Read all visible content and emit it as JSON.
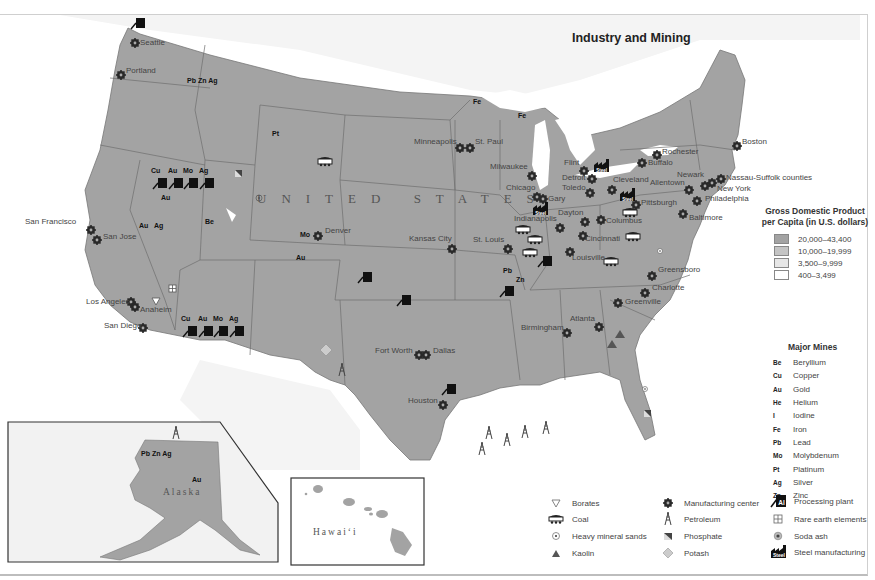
{
  "title": "Industry and Mining",
  "country_label": "UNITED STATES",
  "colors": {
    "gdp_high": "#a3a3a3",
    "gdp_mid": "#c4c4c4",
    "gdp_low": "#e6e6e6",
    "gdp_lowest": "#ffffff",
    "state_border": "#6a6a6a",
    "water": "#ffffff",
    "foreign_land": "#ececec"
  },
  "gdp_legend": {
    "title_line1": "Gross Domestic Product",
    "title_line2": "per Capita (in U.S. dollars)",
    "ranges": [
      {
        "label": "20,000–43,400",
        "color": "#a3a3a3"
      },
      {
        "label": "10,000–19,999",
        "color": "#c4c4c4"
      },
      {
        "label": "3,500–9,999",
        "color": "#e6e6e6"
      },
      {
        "label": "400–3,499",
        "color": "#ffffff"
      }
    ]
  },
  "mines_legend": {
    "title": "Major Mines",
    "items": [
      {
        "abbr": "Be",
        "name": "Beryllium"
      },
      {
        "abbr": "Cu",
        "name": "Copper"
      },
      {
        "abbr": "Au",
        "name": "Gold"
      },
      {
        "abbr": "He",
        "name": "Helium"
      },
      {
        "abbr": "I",
        "name": "Iodine"
      },
      {
        "abbr": "Fe",
        "name": "Iron"
      },
      {
        "abbr": "Pb",
        "name": "Lead"
      },
      {
        "abbr": "Mo",
        "name": "Molybdenum"
      },
      {
        "abbr": "Pt",
        "name": "Platinum"
      },
      {
        "abbr": "Ag",
        "name": "Silver"
      },
      {
        "abbr": "Zn",
        "name": "Zinc"
      }
    ]
  },
  "symbol_legend": {
    "col1": [
      {
        "icon": "borates-triangle-icon",
        "label": "Borates"
      },
      {
        "icon": "coal-car-icon",
        "label": "Coal"
      },
      {
        "icon": "heavy-mineral-sands-icon",
        "label": "Heavy mineral sands"
      },
      {
        "icon": "kaolin-triangle-icon",
        "label": "Kaolin"
      }
    ],
    "col2": [
      {
        "icon": "manufacturing-gear-icon",
        "label": "Manufacturing center"
      },
      {
        "icon": "petroleum-derrick-icon",
        "label": "Petroleum"
      },
      {
        "icon": "phosphate-icon",
        "label": "Phosphate"
      },
      {
        "icon": "potash-diamond-icon",
        "label": "Potash"
      }
    ],
    "col3": [
      {
        "icon": "processing-plant-icon",
        "label": "Processing plant",
        "glyph": "Al"
      },
      {
        "icon": "rare-earth-icon",
        "label": "Rare earth elements"
      },
      {
        "icon": "soda-ash-icon",
        "label": "Soda ash"
      },
      {
        "icon": "steel-factory-icon",
        "label": "Steel manufacturing",
        "glyph": "Steel"
      }
    ]
  },
  "cities": [
    {
      "name": "Seattle",
      "x": 140,
      "y": 43
    },
    {
      "name": "Portland",
      "x": 126,
      "y": 71
    },
    {
      "name": "San Francisco",
      "x": 25,
      "y": 222
    },
    {
      "name": "San Jose",
      "x": 103,
      "y": 237
    },
    {
      "name": "Los Angeles",
      "x": 86,
      "y": 302
    },
    {
      "name": "Anaheim",
      "x": 140,
      "y": 310
    },
    {
      "name": "San Diego",
      "x": 104,
      "y": 326
    },
    {
      "name": "Denver",
      "x": 325,
      "y": 231
    },
    {
      "name": "Minneapolis",
      "x": 414,
      "y": 142
    },
    {
      "name": "St. Paul",
      "x": 475,
      "y": 142
    },
    {
      "name": "Milwaukee",
      "x": 490,
      "y": 167
    },
    {
      "name": "Chicago",
      "x": 506,
      "y": 188
    },
    {
      "name": "Gary",
      "x": 548,
      "y": 199
    },
    {
      "name": "Flint",
      "x": 564,
      "y": 163
    },
    {
      "name": "Detroit",
      "x": 562,
      "y": 178
    },
    {
      "name": "Toledo",
      "x": 562,
      "y": 188
    },
    {
      "name": "Cleveland",
      "x": 613,
      "y": 180
    },
    {
      "name": "Pittsburgh",
      "x": 641,
      "y": 203
    },
    {
      "name": "Rochester",
      "x": 662,
      "y": 152
    },
    {
      "name": "Buffalo",
      "x": 648,
      "y": 163
    },
    {
      "name": "Boston",
      "x": 742,
      "y": 142
    },
    {
      "name": "Newark",
      "x": 677,
      "y": 175
    },
    {
      "name": "Allentown",
      "x": 650,
      "y": 183
    },
    {
      "name": "Nassau-Suffolk counties",
      "x": 726,
      "y": 178
    },
    {
      "name": "New York",
      "x": 717,
      "y": 189
    },
    {
      "name": "Philadelphia",
      "x": 705,
      "y": 199
    },
    {
      "name": "Baltimore",
      "x": 689,
      "y": 218
    },
    {
      "name": "Indianapolis",
      "x": 514,
      "y": 219
    },
    {
      "name": "Dayton",
      "x": 558,
      "y": 213
    },
    {
      "name": "Columbus",
      "x": 606,
      "y": 221
    },
    {
      "name": "Cincinnati",
      "x": 585,
      "y": 239
    },
    {
      "name": "Kansas City",
      "x": 409,
      "y": 239
    },
    {
      "name": "St. Louis",
      "x": 473,
      "y": 240
    },
    {
      "name": "Louisville",
      "x": 572,
      "y": 258
    },
    {
      "name": "Greensboro",
      "x": 658,
      "y": 270
    },
    {
      "name": "Charlotte",
      "x": 652,
      "y": 288
    },
    {
      "name": "Greenville",
      "x": 625,
      "y": 302
    },
    {
      "name": "Atlanta",
      "x": 570,
      "y": 319
    },
    {
      "name": "Birmingham",
      "x": 521,
      "y": 328
    },
    {
      "name": "Fort Worth",
      "x": 375,
      "y": 351
    },
    {
      "name": "Dallas",
      "x": 433,
      "y": 351
    },
    {
      "name": "Houston",
      "x": 408,
      "y": 401
    }
  ],
  "mine_labels": [
    {
      "text": "Pb Zn Ag",
      "x": 187,
      "y": 82
    },
    {
      "text": "Pt",
      "x": 272,
      "y": 135
    },
    {
      "text": "Fe",
      "x": 473,
      "y": 103
    },
    {
      "text": "Fe",
      "x": 518,
      "y": 117
    },
    {
      "text": "Cu",
      "x": 151,
      "y": 172
    },
    {
      "text": "Au",
      "x": 168,
      "y": 172
    },
    {
      "text": "Mo",
      "x": 183,
      "y": 172
    },
    {
      "text": "Ag",
      "x": 199,
      "y": 172
    },
    {
      "text": "Au",
      "x": 161,
      "y": 199
    },
    {
      "text": "Au",
      "x": 139,
      "y": 227
    },
    {
      "text": "Ag",
      "x": 154,
      "y": 227
    },
    {
      "text": "Be",
      "x": 205,
      "y": 223
    },
    {
      "text": "Mo",
      "x": 300,
      "y": 236
    },
    {
      "text": "Au",
      "x": 296,
      "y": 259
    },
    {
      "text": "Cu",
      "x": 181,
      "y": 320
    },
    {
      "text": "Au",
      "x": 198,
      "y": 320
    },
    {
      "text": "Mo",
      "x": 213,
      "y": 320
    },
    {
      "text": "Ag",
      "x": 229,
      "y": 320
    },
    {
      "text": "Pb",
      "x": 503,
      "y": 272
    },
    {
      "text": "Zn",
      "x": 516,
      "y": 281
    }
  ],
  "insets": {
    "alaska": {
      "label": "Alaska",
      "mine_label_1": "Pb Zn Ag",
      "mine_label_2": "Au"
    },
    "hawaii": {
      "label": "Hawai‘i"
    }
  }
}
